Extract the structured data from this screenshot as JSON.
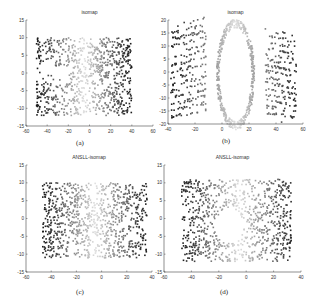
{
  "chart_data": [
    {
      "id": "a",
      "type": "scatter",
      "title": "isomap",
      "caption": "(a)",
      "xlabel": "",
      "ylabel": "",
      "xlim": [
        -60,
        60
      ],
      "ylim": [
        -15,
        15
      ],
      "xticks": [
        -60,
        -40,
        -20,
        0,
        20,
        40,
        60
      ],
      "yticks": [
        -15,
        -10,
        -5,
        0,
        5,
        10,
        15
      ],
      "grid": false,
      "legend": "none",
      "shape": "rectangle",
      "extent": {
        "x": [
          -50,
          40
        ],
        "y": [
          -12,
          10
        ]
      },
      "color_encoding": "grayscale by |x| (dark at edges, light near center)",
      "notes": "Rectangular point cloud with a horizontal gap around y≈-2 on the left side"
    },
    {
      "id": "b",
      "type": "scatter",
      "title": "isomap",
      "caption": "(b)",
      "xlabel": "",
      "ylabel": "",
      "xlim": [
        -40,
        60
      ],
      "ylim": [
        -20,
        20
      ],
      "xticks": [
        -40,
        -20,
        0,
        20,
        40,
        60
      ],
      "yticks": [
        -20,
        -15,
        -10,
        -5,
        0,
        5,
        10,
        15,
        20
      ],
      "grid": false,
      "legend": "none",
      "shape": "ring with empty ellipse hole",
      "extent": {
        "x": [
          -38,
          55
        ],
        "y": [
          -19,
          17
        ]
      },
      "hole": {
        "cx": 10,
        "cy": -1,
        "rx": 12,
        "ry": 18
      },
      "color_encoding": "grayscale by |x-10|",
      "notes": "Distorted embedding: dark streaked strands on left and right, light elliptical loop in center"
    },
    {
      "id": "c",
      "type": "scatter",
      "title": "ANSLL-isomap",
      "caption": "(c)",
      "xlabel": "",
      "ylabel": "",
      "xlim": [
        -60,
        40
      ],
      "ylim": [
        -15,
        15
      ],
      "xticks": [
        -60,
        -40,
        -20,
        0,
        20,
        40
      ],
      "yticks": [
        -15,
        -10,
        -5,
        0,
        5,
        10,
        15
      ],
      "grid": false,
      "legend": "none",
      "shape": "rectangle",
      "extent": {
        "x": [
          -47,
          36
        ],
        "y": [
          -11,
          10
        ]
      },
      "color_encoding": "grayscale by |x| (dark at edges, light near center)"
    },
    {
      "id": "d",
      "type": "scatter",
      "title": "ANSLL-isomap",
      "caption": "(d)",
      "xlabel": "",
      "ylabel": "",
      "xlim": [
        -60,
        40
      ],
      "ylim": [
        -15,
        15
      ],
      "xticks": [
        -60,
        -40,
        -20,
        0,
        20,
        40
      ],
      "yticks": [
        -15,
        -10,
        -5,
        0,
        5,
        10,
        15
      ],
      "grid": false,
      "legend": "none",
      "shape": "rectangle with central hole",
      "extent": {
        "x": [
          -47,
          33
        ],
        "y": [
          -12,
          11
        ]
      },
      "hole": {
        "cx": -12,
        "cy": -2,
        "rx": 10,
        "ry": 5
      },
      "color_encoding": "grayscale by |x| (dark at edges, light near center)"
    }
  ]
}
